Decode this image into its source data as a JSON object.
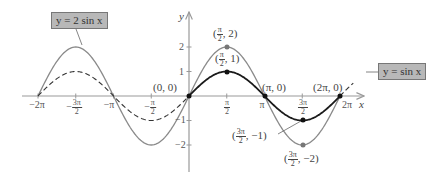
{
  "chart_data": {
    "type": "line",
    "title": "",
    "xlabel": "x",
    "ylabel": "y",
    "xlim": [
      -6.283,
      6.283
    ],
    "ylim": [
      -2,
      2
    ],
    "x_ticks": [
      "-2π",
      "-3π/2",
      "-π",
      "-π/2",
      "π/2",
      "π",
      "3π/2",
      "2π"
    ],
    "y_ticks": [
      "2",
      "1",
      "-1",
      "-2"
    ],
    "series": [
      {
        "name": "y = 2 sin x",
        "color": "#8a8a8a",
        "style": "solid",
        "function": "2*sin(x)",
        "domain": [
          -6.283,
          6.283
        ]
      },
      {
        "name": "y = sin x",
        "color": "#1a1a1a",
        "style": "solid on [0, 2π], dashed elsewhere",
        "function": "sin(x)",
        "domain": [
          -6.283,
          6.283
        ]
      }
    ],
    "points": [
      {
        "label": "(0, 0)",
        "x": 0,
        "y": 0
      },
      {
        "label": "(π/2, 2)",
        "x": 1.5708,
        "y": 2
      },
      {
        "label": "(π/2, 1)",
        "x": 1.5708,
        "y": 1
      },
      {
        "label": "(π, 0)",
        "x": 3.1416,
        "y": 0
      },
      {
        "label": "(3π/2, -1)",
        "x": 4.7124,
        "y": -1
      },
      {
        "label": "(3π/2, -2)",
        "x": 4.7124,
        "y": -2
      },
      {
        "label": "(2π, 0)",
        "x": 6.2832,
        "y": 0
      }
    ],
    "legend": [
      "y = 2 sin x",
      "y = sin x"
    ],
    "grid": false
  },
  "labels": {
    "curve_2sin": "y = 2 sin x",
    "curve_sin": "y = sin x",
    "axis_x": "x",
    "axis_y": "y",
    "pt_origin": "(0, 0)",
    "pt_pi": "(π, 0)",
    "pt_2pi": "(2π, 0)",
    "pi": "π",
    "three_pi": "3π",
    "two": "2",
    "sep_2": ", 2)",
    "sep_1": ", 1)",
    "sep_m1": ", −1)",
    "sep_m2": ", −2)",
    "open": "("
  },
  "ticks": {
    "x": {
      "neg2pi": "−2π",
      "negpi": "−π",
      "twopi": "2π",
      "pi": "π",
      "minus": "−",
      "three_pi": "3π",
      "pi_sym": "π",
      "two": "2"
    },
    "y": {
      "p2": "2",
      "p1": "1",
      "m1": "−1",
      "m2": "−2"
    }
  },
  "colors": {
    "curve_2sin": "#8a8a8a",
    "curve_sin": "#1a1a1a",
    "axis": "#999999",
    "label_box": "#b8b8b8"
  }
}
